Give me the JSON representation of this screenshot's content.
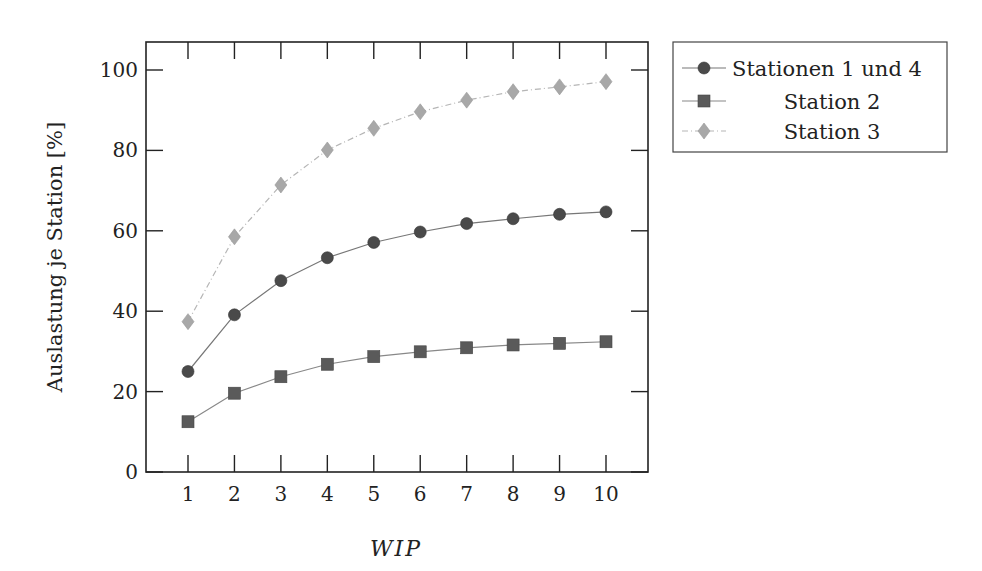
{
  "chart_data": {
    "type": "line",
    "title": "",
    "xlabel": "WIP",
    "ylabel": "Auslastung je Station [%]",
    "x": [
      1,
      2,
      3,
      4,
      5,
      6,
      7,
      8,
      9,
      10
    ],
    "xlim": [
      0.1,
      10.9
    ],
    "ylim": [
      0,
      107
    ],
    "xticks": [
      1,
      2,
      3,
      4,
      5,
      6,
      7,
      8,
      9,
      10
    ],
    "yticks": [
      0,
      20,
      40,
      60,
      80,
      100
    ],
    "grid": false,
    "legend_position": "outside-top-right",
    "series": [
      {
        "name": "Stationen 1 und 4",
        "marker": "circle",
        "line_style": "solid",
        "color": "#4a4a4a",
        "line_color": "#777777",
        "values": [
          25.0,
          39.1,
          47.6,
          53.3,
          57.1,
          59.7,
          61.8,
          63.0,
          64.1,
          64.7
        ]
      },
      {
        "name": "Station 2",
        "marker": "square",
        "line_style": "solid",
        "color": "#5a5a5a",
        "line_color": "#888888",
        "values": [
          12.5,
          19.6,
          23.7,
          26.8,
          28.7,
          29.9,
          30.9,
          31.6,
          32.0,
          32.4
        ]
      },
      {
        "name": "Station 3",
        "marker": "diamond",
        "line_style": "dashdotted",
        "color": "#a8a8a8",
        "line_color": "#b5b5b5",
        "values": [
          37.4,
          58.5,
          71.4,
          80.1,
          85.5,
          89.6,
          92.5,
          94.6,
          95.8,
          97.1
        ]
      }
    ]
  }
}
